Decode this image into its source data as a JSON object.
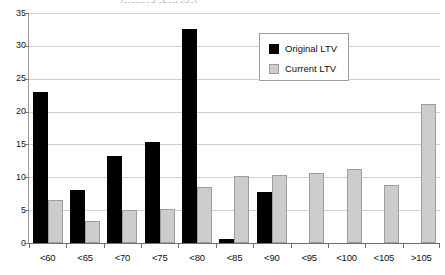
{
  "chart_data": {
    "type": "bar",
    "title": "",
    "xlabel": "",
    "ylabel": "",
    "ylim": [
      0,
      35
    ],
    "yticks": [
      0,
      5,
      10,
      15,
      20,
      25,
      30,
      35
    ],
    "grid": true,
    "legend_position": "inside-top-right",
    "categories": [
      "<60",
      "<65",
      "<70",
      "<75",
      "<80",
      "<85",
      "<90",
      "<95",
      "<100",
      "<105",
      ">105"
    ],
    "series": [
      {
        "name": "Original LTV",
        "color": "#000000",
        "values": [
          23.0,
          8.0,
          13.3,
          15.3,
          32.6,
          0.6,
          7.7,
          null,
          null,
          null,
          null
        ]
      },
      {
        "name": "Current LTV",
        "color": "#cccccc",
        "values": [
          6.5,
          3.3,
          5.1,
          5.2,
          8.6,
          10.2,
          10.3,
          10.7,
          11.2,
          8.9,
          21.2
        ]
      }
    ]
  },
  "legend": {
    "items": [
      {
        "label": "Original LTV",
        "swatch": "black-square-swatch"
      },
      {
        "label": "Current LTV",
        "swatch": "gray-square-swatch"
      }
    ]
  },
  "title_remnant": "(cropped chart title)"
}
